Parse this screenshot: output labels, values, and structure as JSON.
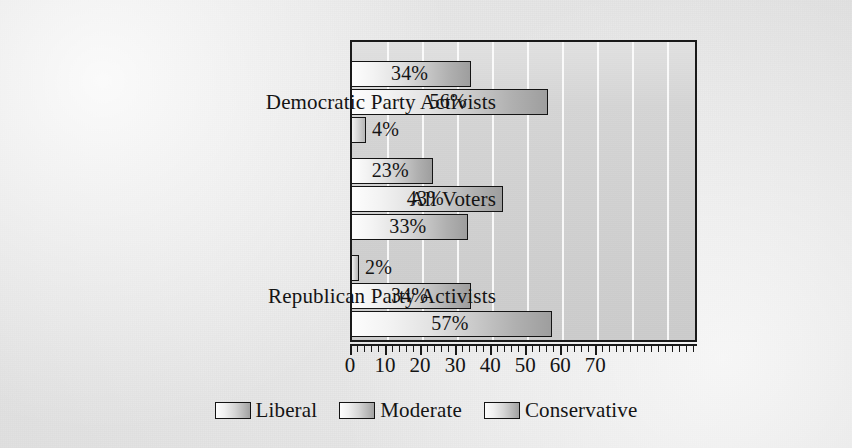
{
  "chart_data": {
    "type": "bar",
    "orientation": "horizontal",
    "title": "",
    "subtitle": "",
    "xlabel": "",
    "ylabel": "",
    "xlim": [
      0,
      99
    ],
    "grid": true,
    "gridlines": [
      10,
      20,
      30,
      40,
      50,
      60,
      70,
      80,
      90
    ],
    "legend_position": "bottom-center",
    "categories": [
      "Democratic Party Activists",
      "All Voters",
      "Republican Party Activists"
    ],
    "series": [
      {
        "name": "Liberal",
        "values": [
          34,
          23,
          2
        ],
        "labels": [
          "34%",
          "23%",
          "2%"
        ]
      },
      {
        "name": "Moderate",
        "values": [
          56,
          43,
          34
        ],
        "labels": [
          "56%",
          "34%",
          "34%"
        ]
      },
      {
        "name": "Conservative",
        "values": [
          4,
          33,
          57
        ],
        "labels": [
          "4%",
          "33%",
          "57%"
        ]
      }
    ],
    "bars": [
      {
        "group": "Democratic Party Activists",
        "series": "Liberal",
        "value": 34,
        "label": "34%",
        "label_placement": "inside"
      },
      {
        "group": "Democratic Party Activists",
        "series": "Moderate",
        "value": 56,
        "label": "56%",
        "label_placement": "inside"
      },
      {
        "group": "Democratic Party Activists",
        "series": "Conservative",
        "value": 4,
        "label": "4%",
        "label_placement": "outside"
      },
      {
        "group": "All Voters",
        "series": "Liberal",
        "value": 23,
        "label": "23%",
        "label_placement": "inside"
      },
      {
        "group": "All Voters",
        "series": "Moderate",
        "value": 43,
        "label": "43%",
        "label_placement": "inside"
      },
      {
        "group": "All Voters",
        "series": "Conservative",
        "value": 33,
        "label": "33%",
        "label_placement": "inside"
      },
      {
        "group": "Republican Party Activists",
        "series": "Liberal",
        "value": 2,
        "label": "2%",
        "label_placement": "outside"
      },
      {
        "group": "Republican Party Activists",
        "series": "Moderate",
        "value": 34,
        "label": "34%",
        "label_placement": "inside"
      },
      {
        "group": "Republican Party Activists",
        "series": "Conservative",
        "value": 57,
        "label": "57%",
        "label_placement": "inside"
      }
    ],
    "x_axis": {
      "tick_labels": [
        "0",
        "10",
        "20",
        "30",
        "40",
        "50",
        "60",
        "70"
      ],
      "tick_values": [
        0,
        10,
        20,
        30,
        40,
        50,
        60,
        70
      ],
      "minor_tick_interval": 2
    },
    "legend": [
      {
        "label": "Liberal"
      },
      {
        "label": "Moderate"
      },
      {
        "label": "Conservative"
      }
    ],
    "colors": {
      "bar_gradient_light": "#fdfdfd",
      "bar_gradient_dark": "#9e9e9e",
      "bar_outline": "#141414",
      "plot_background": "#d4d4d4",
      "gridline": "#ffffff",
      "page_background": "#ececec",
      "text": "#141414"
    }
  }
}
